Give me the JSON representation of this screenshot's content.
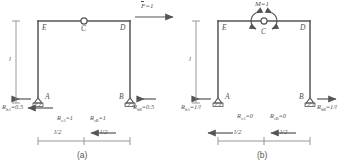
{
  "figure": {
    "type": "structural-diagram",
    "line_color": "#555555",
    "text_color": "#4f4f4f"
  },
  "panels": [
    {
      "id": "a",
      "caption": "(a)",
      "load": {
        "label": "F",
        "overbar": true,
        "equals": "=1",
        "text": "F=1",
        "direction": "right",
        "position": "top-right"
      },
      "nodes": {
        "left_top": "E",
        "center": "C",
        "right_top": "D",
        "left_base": "A",
        "right_base": "B"
      },
      "hinge_at": "C",
      "dimensions": {
        "height": "l",
        "left_span": "l/2",
        "right_span": "l/2"
      },
      "reactions": [
        {
          "name": "R_hA",
          "symbol": "R",
          "sub": "hA",
          "value": "=0.5",
          "text": "R",
          "full": "R hA =0.5",
          "direction": "left",
          "at": "A"
        },
        {
          "name": "R_vA",
          "symbol": "R",
          "sub": "vA",
          "value": "=1",
          "full": "R vA =1",
          "direction": "down",
          "at": "A"
        },
        {
          "name": "R_hB",
          "symbol": "R",
          "sub": "hB",
          "value": "=0.5",
          "full": "R hB =0.5",
          "direction": "left",
          "at": "B"
        },
        {
          "name": "R_vB",
          "symbol": "R",
          "sub": "vB",
          "value": "=1",
          "full": "R vB =1",
          "direction": "up",
          "at": "B"
        }
      ],
      "labels": {
        "hA_sym": "R",
        "hA_sub": "hA",
        "hA_val": "=0.5",
        "vA_sym": "R",
        "vA_sub": "vA",
        "vA_val": "=1",
        "hB_sym": "R",
        "hB_sub": "hB",
        "hB_val": "=0.5",
        "vB_sym": "R",
        "vB_sub": "vB",
        "vB_val": "=1"
      }
    },
    {
      "id": "b",
      "caption": "(b)",
      "load": {
        "label": "M",
        "overbar": true,
        "equals": "=1",
        "text": "M=1",
        "direction": "moment",
        "position": "at-hinge-C"
      },
      "nodes": {
        "left_top": "E",
        "center": "C",
        "right_top": "D",
        "left_base": "A",
        "right_base": "B"
      },
      "hinge_at": "C",
      "dimensions": {
        "height": "l",
        "left_span": "l/2",
        "right_span": "l/2"
      },
      "reactions": [
        {
          "name": "R_hA",
          "symbol": "R",
          "sub": "hA",
          "value": "=1/l",
          "direction": "left",
          "at": "A"
        },
        {
          "name": "R_vA",
          "symbol": "R",
          "sub": "vA",
          "value": "=0",
          "direction": "up",
          "at": "A"
        },
        {
          "name": "R_hB",
          "symbol": "R",
          "sub": "hB",
          "value": "=1/l",
          "direction": "right",
          "at": "B"
        },
        {
          "name": "R_vB",
          "symbol": "R",
          "sub": "vB",
          "value": "=0",
          "direction": "up",
          "at": "B"
        }
      ],
      "labels": {
        "hA_sym": "R",
        "hA_sub": "hA",
        "hA_val": "=1/l",
        "vA_sym": "R",
        "vA_sub": "vA",
        "vA_val": "=0",
        "hB_sym": "R",
        "hB_sub": "hB",
        "hB_val": "=1/l",
        "vB_sym": "R",
        "vB_sub": "vB",
        "vB_val": "=0"
      }
    }
  ]
}
